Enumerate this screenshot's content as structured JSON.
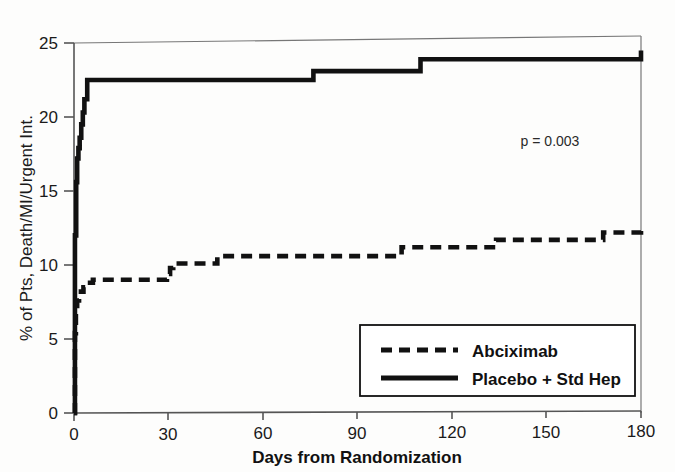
{
  "chart_data": {
    "type": "line",
    "subtype": "kaplan-meier-step",
    "title": "",
    "xlabel": "Days from Randomization",
    "ylabel": "% of Pts, Death/MI/Urgent Int.",
    "xlim": [
      0,
      180
    ],
    "ylim": [
      0,
      25
    ],
    "xticks": [
      0,
      30,
      60,
      90,
      120,
      150,
      180
    ],
    "yticks": [
      0,
      5,
      10,
      15,
      20,
      25
    ],
    "xtick_labels": [
      "0",
      "30",
      "60",
      "90",
      "120",
      "150",
      "180"
    ],
    "ytick_labels": [
      "0",
      "5",
      "10",
      "15",
      "20",
      "25"
    ],
    "grid": false,
    "legend_position": "lower right",
    "annotations": [
      {
        "name": "p-value",
        "text": "p = 0.003",
        "x": 133,
        "y": 13.6
      }
    ],
    "series": [
      {
        "name": "Abciximab",
        "style": "dashed",
        "color": "#111111",
        "points": [
          [
            0,
            0.0
          ],
          [
            0.3,
            5.4
          ],
          [
            0.6,
            6.9
          ],
          [
            1.0,
            7.6
          ],
          [
            1.6,
            7.9
          ],
          [
            2.2,
            8.2
          ],
          [
            3.0,
            8.5
          ],
          [
            4.0,
            8.8
          ],
          [
            6.0,
            9.0
          ],
          [
            28.0,
            9.0
          ],
          [
            29.5,
            9.4
          ],
          [
            30.5,
            9.8
          ],
          [
            31.5,
            10.1
          ],
          [
            44.0,
            10.1
          ],
          [
            45.5,
            10.6
          ],
          [
            102.0,
            10.6
          ],
          [
            104.0,
            11.2
          ],
          [
            132.0,
            11.2
          ],
          [
            134.0,
            11.7
          ],
          [
            166.0,
            11.7
          ],
          [
            168.0,
            12.2
          ],
          [
            180.0,
            12.3
          ]
        ]
      },
      {
        "name": "Placebo + Std Hep",
        "style": "solid",
        "color": "#111111",
        "points": [
          [
            0,
            0.0
          ],
          [
            0.3,
            12.0
          ],
          [
            0.7,
            15.6
          ],
          [
            1.0,
            17.2
          ],
          [
            1.4,
            17.9
          ],
          [
            1.8,
            18.6
          ],
          [
            2.3,
            19.5
          ],
          [
            2.8,
            20.3
          ],
          [
            3.3,
            21.2
          ],
          [
            4.2,
            22.5
          ],
          [
            74.0,
            22.5
          ],
          [
            76.0,
            23.1
          ],
          [
            108.0,
            23.1
          ],
          [
            110.0,
            23.9
          ],
          [
            180.0,
            24.5
          ]
        ]
      }
    ]
  },
  "legend": {
    "entries": [
      {
        "label": "Abciximab",
        "style": "dashed"
      },
      {
        "label": "Placebo + Std Hep",
        "style": "solid"
      }
    ]
  },
  "axes": {
    "x_title": "Days from Randomization",
    "y_title": "% of Pts, Death/MI/Urgent Int.",
    "x_ticks": [
      "0",
      "30",
      "60",
      "90",
      "120",
      "150",
      "180"
    ],
    "y_ticks": [
      "0",
      "5",
      "10",
      "15",
      "20",
      "25"
    ]
  },
  "annotation": {
    "p_value": "p = 0.003"
  },
  "colors": {
    "line": "#111111",
    "axis": "#555555",
    "background": "#fdfdfc"
  }
}
